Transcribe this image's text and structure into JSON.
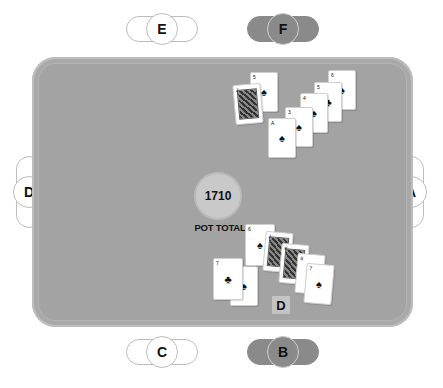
{
  "table": {
    "felt_color": "#a3a3a3",
    "pot": {
      "amount": "1710",
      "label": "POT TOTAL"
    },
    "dealer_button": "D"
  },
  "seats": {
    "E": {
      "label": "E",
      "state": "empty"
    },
    "F": {
      "label": "F",
      "state": "occupied"
    },
    "D": {
      "label": "D",
      "state": "empty"
    },
    "A": {
      "label": "A",
      "state": "empty"
    },
    "C": {
      "label": "C",
      "state": "empty"
    },
    "B": {
      "label": "B",
      "state": "occupied"
    }
  },
  "cards": {
    "top_group": [
      {
        "rank": "J",
        "suit": "♠",
        "face": true
      },
      {
        "rank": "5",
        "suit": "♠"
      },
      {
        "rank": "A",
        "suit": "♠"
      },
      {
        "rank": "3",
        "suit": "♠"
      },
      {
        "rank": "4",
        "suit": "♠"
      },
      {
        "rank": "5",
        "suit": "♣"
      },
      {
        "rank": "6",
        "suit": "♠"
      }
    ],
    "bottom_group": [
      {
        "rank": "7",
        "suit": "♣"
      },
      {
        "rank": "2",
        "suit": "♠"
      },
      {
        "rank": "6",
        "suit": "♠"
      },
      {
        "rank": "J",
        "suit": "♠",
        "face": true
      },
      {
        "rank": "K",
        "suit": "♠",
        "face": true
      },
      {
        "rank": "8",
        "suit": "♣"
      },
      {
        "rank": "7",
        "suit": "♠"
      }
    ]
  }
}
